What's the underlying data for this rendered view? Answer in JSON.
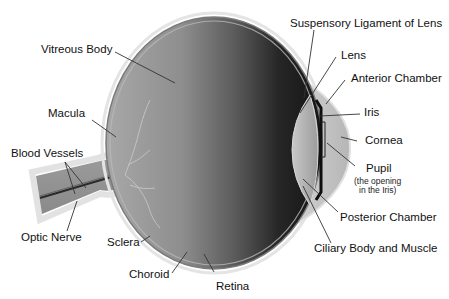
{
  "diagram": {
    "colors": {
      "background": "#ffffff",
      "sclera_outline": "#dcdcdc",
      "eyeball_light": "#9a9a9a",
      "eyeball_dark": "#1e1e1e",
      "cornea": "#c4c4c4",
      "lens": "#b0b0b0",
      "leader_line": "#333333",
      "text": "#111111"
    },
    "labels": {
      "suspensory_ligament": "Suspensory Ligament of Lens",
      "lens": "Lens",
      "anterior_chamber": "Anterior Chamber",
      "iris": "Iris",
      "cornea": "Cornea",
      "pupil": "Pupil",
      "pupil_note_line1": "(the opening",
      "pupil_note_line2": "in the Iris)",
      "posterior_chamber": "Posterior Chamber",
      "ciliary_body": "Ciliary Body and Muscle",
      "vitreous_body": "Vitreous Body",
      "macula": "Macula",
      "blood_vessels": "Blood Vessels",
      "optic_nerve": "Optic Nerve",
      "sclera": "Sclera",
      "choroid": "Choroid",
      "retina": "Retina"
    }
  }
}
